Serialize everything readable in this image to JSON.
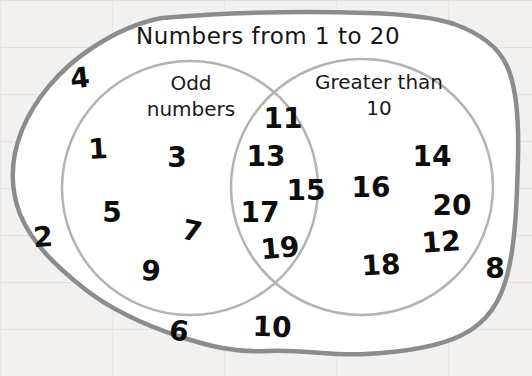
{
  "title": "Numbers from 1 to 20",
  "colors": {
    "background": "#f2f1f0",
    "panel_fill": "#ffffff",
    "outer_outline": "#8c8c8c",
    "circle_outline": "#b3b3b3",
    "text": "#0d0d0d"
  },
  "venn": {
    "left_label": "Odd numbers",
    "right_label": "Greater than 10",
    "sets": {
      "odd_only": [
        "1",
        "3",
        "5",
        "7",
        "9"
      ],
      "intersection": [
        "11",
        "13",
        "15",
        "17",
        "19"
      ],
      "greater_than_10_only": [
        "12",
        "14",
        "16",
        "18",
        "20"
      ],
      "outside_circles": [
        "2",
        "4",
        "6",
        "8",
        "10"
      ]
    }
  }
}
